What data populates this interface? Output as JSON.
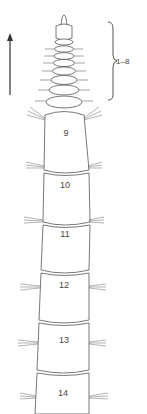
{
  "figure": {
    "direction_arrow": "anterior-arrow",
    "bracket_label": "1–8",
    "segment_labels": [
      "9",
      "10",
      "11",
      "12",
      "13",
      "14"
    ],
    "colors": {
      "line": "#555555",
      "shade": "#bdbdbd",
      "background": "#ffffff"
    }
  }
}
